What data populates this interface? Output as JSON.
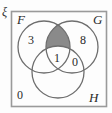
{
  "figure": {
    "type": "venn-diagram-3-set",
    "universe_symbol": "ξ",
    "background_color": "#fdfdfd",
    "frame_color": "#9a9a9a",
    "circle_stroke_color": "#6e6e6e",
    "shade_color": "#8a8a8a",
    "text_color": "#2a2a2a"
  },
  "sets": {
    "f_label": "F",
    "g_label": "G",
    "h_label": "H"
  },
  "regions": [
    {
      "id": "f-only",
      "label": "3",
      "shaded": false
    },
    {
      "id": "g-only",
      "label": "8",
      "shaded": false
    },
    {
      "id": "f-g-only",
      "label": "",
      "shaded": true
    },
    {
      "id": "f-g-h",
      "label": "1",
      "shaded": false
    },
    {
      "id": "g-h-only",
      "label": "0",
      "shaded": false
    },
    {
      "id": "outside-all",
      "label": "0",
      "shaded": false
    }
  ],
  "counts": {
    "f_only": "3",
    "g_only": "8",
    "f_intersect_g_only": "",
    "f_intersect_g_intersect_h": "1",
    "g_intersect_h_only": "0",
    "outside_all_sets": "0"
  }
}
